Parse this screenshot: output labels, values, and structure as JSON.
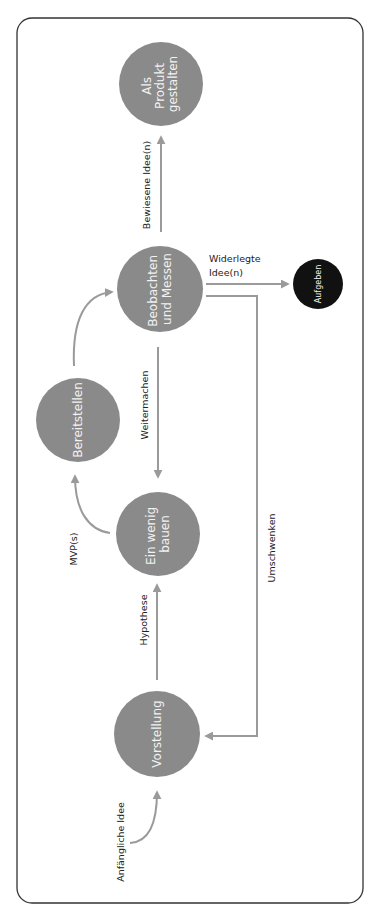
{
  "colors": {
    "node_fill": "#8a8a8a",
    "terminal_fill": "#111111",
    "arrow": "#9a9a9a",
    "frame": "#333333",
    "node_text": "#f2f2f2",
    "label_text": "#222222"
  },
  "nodes": {
    "produkt": {
      "lines": [
        "Als",
        "Produkt",
        "gestalten"
      ]
    },
    "beobachten": {
      "lines": [
        "Beobachten",
        "und Messen"
      ]
    },
    "aufgeben": {
      "lines": [
        "Aufgeben"
      ]
    },
    "bereitstellen": {
      "lines": [
        "Bereitstellen"
      ]
    },
    "bauen": {
      "lines": [
        "Ein wenig",
        "bauen"
      ]
    },
    "vorstellung": {
      "lines": [
        "Vorstellung"
      ]
    }
  },
  "edges": {
    "anfaengliche_idee": "Anfängliche Idee",
    "hypothese": "Hypothese",
    "mvps": "MVP(s)",
    "weitermachen": "Weitermachen",
    "bewiesene_idee": "Bewiesene Idee(n)",
    "widerlegte_idee": [
      "Widerlegte",
      "Idee(n)"
    ],
    "umschwenken": "Umschwenken"
  }
}
